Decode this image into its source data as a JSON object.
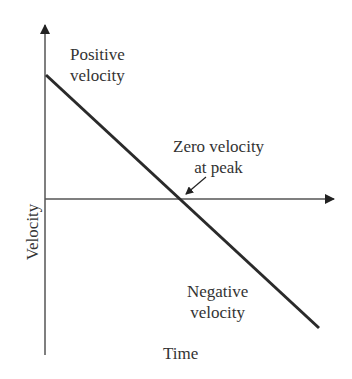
{
  "diagram": {
    "type": "velocity-time graph",
    "axes": {
      "x_label": "Time",
      "y_label": "Velocity"
    },
    "annotations": {
      "positive": [
        "Positive",
        "velocity"
      ],
      "zero": [
        "Zero velocity",
        "at peak"
      ],
      "negative": [
        "Negative",
        "velocity"
      ]
    },
    "colors": {
      "line": "#2a2a2a",
      "axis": "#555555",
      "text": "#333333"
    }
  }
}
